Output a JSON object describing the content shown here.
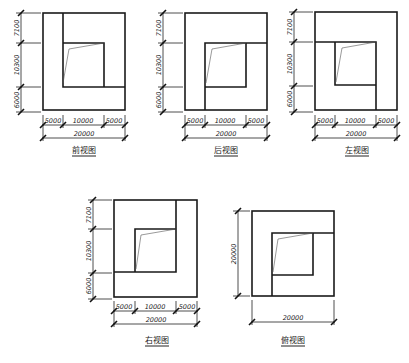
{
  "views": [
    {
      "id": "front",
      "label": "前视图",
      "box": {
        "x": 43,
        "y": 13,
        "w": 82,
        "h": 97
      },
      "vertical_dims": [
        "7100",
        "10300",
        "6000"
      ],
      "horizontal_dims": [
        "5000",
        "10000",
        "5000"
      ],
      "total_width": "20000"
    },
    {
      "id": "back",
      "label": "后视图",
      "box": {
        "x": 185,
        "y": 13,
        "w": 82,
        "h": 97
      },
      "vertical_dims": [
        "7100",
        "10300",
        "6000"
      ],
      "horizontal_dims": [
        "5000",
        "10000",
        "5000"
      ],
      "total_width": "20000"
    },
    {
      "id": "left",
      "label": "左视图",
      "box": {
        "x": 315,
        "y": 12,
        "w": 82,
        "h": 98
      },
      "vertical_dims": [
        "7100",
        "10300",
        "6000"
      ],
      "horizontal_dims": [
        "5000",
        "10000",
        "5000"
      ],
      "total_width": "20000"
    },
    {
      "id": "right",
      "label": "右视图",
      "box": {
        "x": 114,
        "y": 200,
        "w": 83,
        "h": 97
      },
      "vertical_dims": [
        "7100",
        "10300",
        "6000"
      ],
      "horizontal_dims": [
        "5000",
        "10000",
        "5000"
      ],
      "total_width": "20000"
    },
    {
      "id": "top",
      "label": "俯视图",
      "box": {
        "x": 252,
        "y": 211,
        "w": 82,
        "h": 85
      },
      "vertical_dims": [
        "20000"
      ],
      "horizontal_dims": [],
      "total_width": "20000"
    }
  ]
}
